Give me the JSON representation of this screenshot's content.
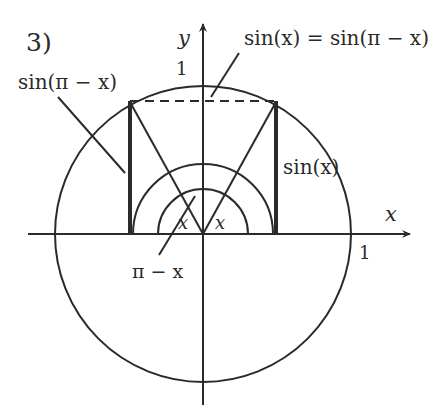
{
  "figure": {
    "panel_label": "3)",
    "axis_labels": {
      "x": "x",
      "y": "y"
    },
    "tick_labels": {
      "x_one": "1",
      "y_one": "1"
    },
    "annotations": {
      "equality": "sin(x) = sin(π − x)",
      "left_segment": "sin(π − x)",
      "right_segment": "sin(x)",
      "angle_right": "x",
      "angle_left": "x",
      "supplementary_angle": "π − x"
    },
    "colors": {
      "stroke": "#2a2a2a",
      "background": "#ffffff"
    },
    "geometry": {
      "unit_circle_radius": 1,
      "angle_x_degrees": 60,
      "point_right": [
        0.5,
        0.866
      ],
      "point_left": [
        -0.5,
        0.866
      ]
    }
  }
}
